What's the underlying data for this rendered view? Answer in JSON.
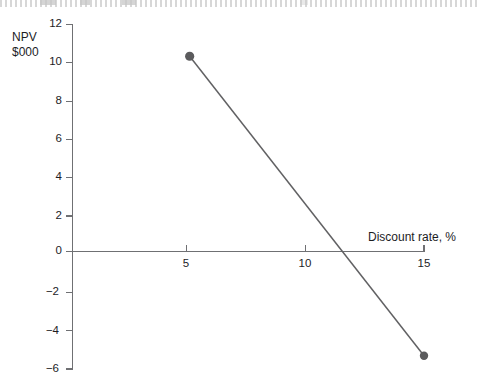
{
  "chart_data": {
    "type": "line",
    "title": "",
    "subtitle": "",
    "xlabel": "Discount rate, %",
    "ylabel": "NPV\n$000",
    "ylabel_lines": [
      "NPV",
      "$000"
    ],
    "x": [
      5,
      15
    ],
    "series": [
      {
        "name": "NPV",
        "values": [
          10.3,
          -5.5
        ]
      }
    ],
    "points": [
      {
        "x": 5,
        "y": 10.3
      },
      {
        "x": 15,
        "y": -5.5
      }
    ],
    "xlim": [
      0,
      15
    ],
    "ylim": [
      -6,
      12
    ],
    "xticks": [
      5,
      10,
      15
    ],
    "xtick_labels": [
      "5",
      "10",
      "15"
    ],
    "yticks": [
      12,
      10,
      8,
      6,
      4,
      2,
      0,
      -2,
      -4,
      -6
    ],
    "ytick_labels": [
      "12",
      "10",
      "8",
      "6",
      "4",
      "2",
      "0",
      "−2",
      "−4",
      "−6"
    ],
    "grid": false,
    "legend": null,
    "zero_crossing_x": 11.5,
    "marker": "circle",
    "annotations": []
  },
  "colors": {
    "line": "#616163",
    "marker": "#5b5b5d",
    "axis": "#6f7073",
    "text": "#1d1d1f",
    "background": "#ffffff"
  },
  "axes": {
    "y_title_line1": "NPV",
    "y_title_line2": "$000",
    "x_title": "Discount rate, %"
  }
}
